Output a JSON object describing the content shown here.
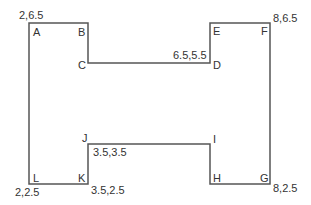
{
  "diagram": {
    "type": "polygon-outline",
    "stroke_color": "#555555",
    "vertices": [
      {
        "id": "A",
        "label": "A",
        "px": [
          29,
          23
        ],
        "coord": "2,6.5"
      },
      {
        "id": "B",
        "label": "B",
        "px": [
          88,
          23
        ]
      },
      {
        "id": "C",
        "label": "C",
        "px": [
          88,
          63
        ]
      },
      {
        "id": "D",
        "label": "D",
        "px": [
          210,
          63
        ],
        "coord": "6.5,5.5"
      },
      {
        "id": "E",
        "label": "E",
        "px": [
          210,
          23
        ]
      },
      {
        "id": "F",
        "label": "F",
        "px": [
          270,
          23
        ],
        "coord": "8,6.5"
      },
      {
        "id": "G",
        "label": "G",
        "px": [
          270,
          184
        ],
        "coord": "8,2.5"
      },
      {
        "id": "H",
        "label": "H",
        "px": [
          210,
          184
        ]
      },
      {
        "id": "I",
        "label": "I",
        "px": [
          210,
          144
        ]
      },
      {
        "id": "J",
        "label": "J",
        "px": [
          88,
          144
        ],
        "coord": "3.5,3.5"
      },
      {
        "id": "K",
        "label": "K",
        "px": [
          88,
          184
        ],
        "coord": "3.5,2.5"
      },
      {
        "id": "L",
        "label": "L",
        "px": [
          29,
          184
        ],
        "coord": "2,2.5"
      }
    ],
    "coord_labels": {
      "A": "2,6.5",
      "D": "6.5,5.5",
      "F": "8,6.5",
      "G": "8,2.5",
      "J": "3.5,3.5",
      "K": "3.5,2.5",
      "L": "2,2.5"
    }
  }
}
